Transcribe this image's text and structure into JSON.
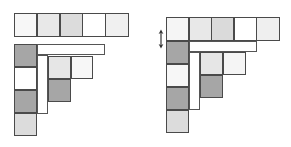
{
  "colors": {
    "white": "#ffffff",
    "very_light": "#f2f2f2",
    "light": "#e6e6e6",
    "medium_light": "#d8d8d8",
    "dark": "#a3a3a3",
    "stroke": "#4a4a4a"
  },
  "figures": [
    {
      "id": "left",
      "top_row": {
        "x": 14,
        "y": 13,
        "cell": 22.8,
        "fills": [
          "#f7f7f7",
          "#e8e8e8",
          "#dcdcdc",
          "#ffffff",
          "#f0f0f0"
        ]
      },
      "column": {
        "x": 14,
        "y": 44,
        "cell": 23,
        "fills": [
          "#a6a6a6",
          "#ffffff",
          "#a6a6a6",
          "#dcdcdc"
        ]
      },
      "h_bar": {
        "x": 37,
        "y": 44,
        "w": 68,
        "h": 11
      },
      "v_bar": {
        "x": 37,
        "y": 55,
        "w": 11,
        "h": 59
      },
      "inner": [
        {
          "x": 48,
          "y": 56,
          "w": 23,
          "h": 23,
          "fill": "#e6e6e6"
        },
        {
          "x": 71,
          "y": 56,
          "w": 22,
          "h": 23,
          "fill": "#f7f7f7"
        },
        {
          "x": 48,
          "y": 79,
          "w": 23,
          "h": 23,
          "fill": "#a6a6a6"
        }
      ]
    },
    {
      "id": "right",
      "top_row": {
        "x": 166,
        "y": 17,
        "cell": 22.6,
        "fills": [
          "#f5f5f5",
          "#e8e8e8",
          "#dadada",
          "#ffffff",
          "#efefef"
        ]
      },
      "column": {
        "x": 166,
        "y": 41,
        "cell": 23,
        "fills": [
          "#a6a6a6",
          "#f7f7f7",
          "#a6a6a6",
          "#dcdcdc"
        ]
      },
      "h_bar": {
        "x": 189,
        "y": 41,
        "w": 68,
        "h": 11
      },
      "v_bar": {
        "x": 189,
        "y": 52,
        "w": 11,
        "h": 58
      },
      "inner": [
        {
          "x": 200,
          "y": 52,
          "w": 23,
          "h": 23,
          "fill": "#e6e6e6"
        },
        {
          "x": 223,
          "y": 52,
          "w": 23,
          "h": 23,
          "fill": "#f5f5f5"
        },
        {
          "x": 200,
          "y": 75,
          "w": 23,
          "h": 23,
          "fill": "#a6a6a6"
        }
      ],
      "arrow": {
        "icon": "double-headed-vertical-arrow",
        "x": 161,
        "y1": 30,
        "y2": 48
      }
    }
  ]
}
